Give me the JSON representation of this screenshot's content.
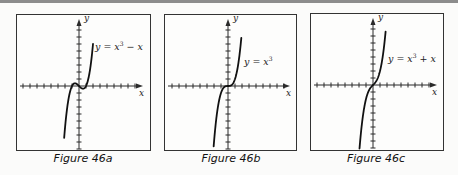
{
  "chart_data": [
    {
      "type": "line",
      "title": "",
      "caption": "Figure 46a",
      "equation": {
        "lhs": "y",
        "rhs_base": "x",
        "rhs_exp": "3",
        "rhs_tail": " − x"
      },
      "function": "x^3 - x",
      "xlabel": "x",
      "ylabel": "y",
      "x_ticks_per_side": 8,
      "y_ticks_up": 8,
      "y_ticks_down": 9,
      "tick_unit": 1,
      "x_range": [
        -2.12,
        2.0
      ],
      "grid": false,
      "key_points": [
        {
          "x": -1,
          "y": 0
        },
        {
          "x": 0,
          "y": 0
        },
        {
          "x": 1,
          "y": 0
        },
        {
          "x": -0.577,
          "y": 0.385
        },
        {
          "x": 0.577,
          "y": -0.385
        }
      ]
    },
    {
      "type": "line",
      "title": "",
      "caption": "Figure 46b",
      "equation": {
        "lhs": "y",
        "rhs_base": "x",
        "rhs_exp": "3",
        "rhs_tail": ""
      },
      "function": "x^3",
      "xlabel": "x",
      "ylabel": "y",
      "x_ticks_per_side": 8,
      "y_ticks_up": 8,
      "y_ticks_down": 9,
      "tick_unit": 1,
      "x_range": [
        -2.05,
        1.9
      ],
      "grid": false,
      "key_points": [
        {
          "x": 0,
          "y": 0
        }
      ]
    },
    {
      "type": "line",
      "title": "",
      "caption": "Figure 46c",
      "equation": {
        "lhs": "y",
        "rhs_base": "x",
        "rhs_exp": "3",
        "rhs_tail": " + x"
      },
      "function": "x^3 + x",
      "xlabel": "x",
      "ylabel": "y",
      "x_ticks_per_side": 8,
      "y_ticks_up": 8,
      "y_ticks_down": 9,
      "tick_unit": 1,
      "x_range": [
        -1.95,
        1.8
      ],
      "grid": false,
      "key_points": [
        {
          "x": 0,
          "y": 0
        }
      ]
    }
  ],
  "figures": [
    {
      "caption": "Figure 46a",
      "eq_prefix": "y = x",
      "eq_exp": "3",
      "eq_suffix": " − x",
      "xlabel": "x",
      "ylabel": "y"
    },
    {
      "caption": "Figure 46b",
      "eq_prefix": "y = x",
      "eq_exp": "3",
      "eq_suffix": "",
      "xlabel": "x",
      "ylabel": "y"
    },
    {
      "caption": "Figure 46c",
      "eq_prefix": "y = x",
      "eq_exp": "3",
      "eq_suffix": " + x",
      "xlabel": "x",
      "ylabel": "y"
    }
  ],
  "colors": {
    "axis": "#2a2a2a",
    "curve": "#111111",
    "frame": "#333333",
    "background": "#fbfbfa"
  }
}
